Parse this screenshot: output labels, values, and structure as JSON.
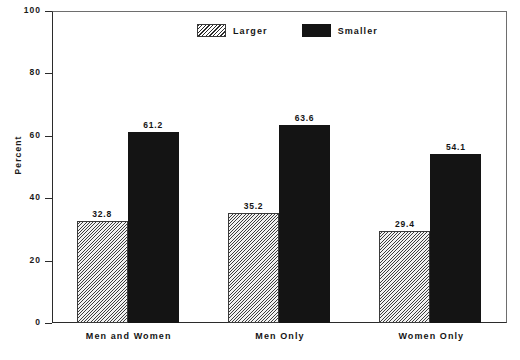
{
  "chart_data": {
    "type": "bar",
    "title": "",
    "subtitle": "",
    "xlabel": "",
    "ylabel": "Percent",
    "ylim": [
      0,
      100
    ],
    "yticks": [
      0,
      20,
      40,
      60,
      80,
      100
    ],
    "ytick_labels": [
      "0",
      "20",
      "40",
      "60",
      "80",
      "100"
    ],
    "grid": false,
    "legend_position": "top-center",
    "categories": [
      "Men and Women",
      "Men Only",
      "Women Only"
    ],
    "series": [
      {
        "name": "Larger",
        "values": [
          32.8,
          35.2,
          29.4
        ],
        "value_labels": [
          "32.8",
          "35.2",
          "29.4"
        ],
        "fill": "diagonal-hatch",
        "color": "#3d3d3d"
      },
      {
        "name": "Smaller",
        "values": [
          61.2,
          63.6,
          54.1
        ],
        "value_labels": [
          "61.2",
          "63.6",
          "54.1"
        ],
        "fill": "solid",
        "color": "#141414"
      }
    ]
  },
  "axis": {
    "y_title": "Percent"
  },
  "legend": {
    "items": [
      {
        "label": "Larger",
        "swatch": "hatch-swatch-icon"
      },
      {
        "label": "Smaller",
        "swatch": "solid-swatch-icon"
      }
    ]
  }
}
